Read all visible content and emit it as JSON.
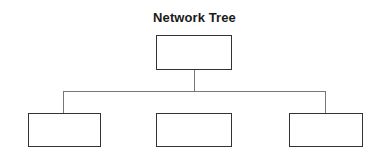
{
  "diagram": {
    "title": "Network Tree",
    "root": {
      "label": "",
      "box": {
        "x": 156,
        "y": 35,
        "w": 76,
        "h": 35
      }
    },
    "children": [
      {
        "label": "",
        "connected": true,
        "box": {
          "x": 28,
          "y": 113,
          "w": 73,
          "h": 34
        }
      },
      {
        "label": "",
        "connected": false,
        "box": {
          "x": 156,
          "y": 113,
          "w": 76,
          "h": 34
        }
      },
      {
        "label": "",
        "connected": true,
        "box": {
          "x": 289,
          "y": 113,
          "w": 74,
          "h": 34
        }
      }
    ],
    "colors": {
      "node_border": "#333333",
      "connector": "#777777",
      "title": "#1a1a1a",
      "background": "#ffffff"
    }
  }
}
